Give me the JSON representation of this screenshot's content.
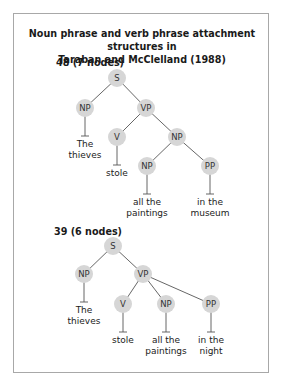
{
  "figure": {
    "title_line1": "Noun phrase and verb phrase attachment structures in",
    "title_line2": "Taraban and McClelland (1988)"
  },
  "trees": [
    {
      "label": "48 (7 nodes)",
      "nodes": [
        {
          "id": "S",
          "label": "S",
          "x": 117,
          "y": 78
        },
        {
          "id": "NP1",
          "label": "NP",
          "x": 85,
          "y": 108
        },
        {
          "id": "VP",
          "label": "VP",
          "x": 146,
          "y": 108
        },
        {
          "id": "V",
          "label": "V",
          "x": 117,
          "y": 137
        },
        {
          "id": "NP2",
          "label": "NP",
          "x": 177,
          "y": 137
        },
        {
          "id": "NP3",
          "label": "NP",
          "x": 147,
          "y": 166
        },
        {
          "id": "PP",
          "label": "PP",
          "x": 210,
          "y": 166
        }
      ],
      "edges": [
        [
          "S",
          "NP1"
        ],
        [
          "S",
          "VP"
        ],
        [
          "VP",
          "V"
        ],
        [
          "VP",
          "NP2"
        ],
        [
          "NP2",
          "NP3"
        ],
        [
          "NP2",
          "PP"
        ]
      ],
      "leaves": [
        {
          "node": "NP1",
          "lines": [
            "The",
            "thieves"
          ]
        },
        {
          "node": "V",
          "lines": [
            "stole"
          ]
        },
        {
          "node": "NP3",
          "lines": [
            "all the",
            "paintings"
          ]
        },
        {
          "node": "PP",
          "lines": [
            "in the",
            "museum"
          ]
        }
      ]
    },
    {
      "label": "39 (6 nodes)",
      "nodes": [
        {
          "id": "S",
          "label": "S",
          "x": 113,
          "y": 246
        },
        {
          "id": "NP1",
          "label": "NP",
          "x": 84,
          "y": 274
        },
        {
          "id": "VP",
          "label": "VP",
          "x": 143,
          "y": 274
        },
        {
          "id": "V",
          "label": "V",
          "x": 123,
          "y": 304
        },
        {
          "id": "NP2",
          "label": "NP",
          "x": 166,
          "y": 304
        },
        {
          "id": "PP",
          "label": "PP",
          "x": 211,
          "y": 304
        }
      ],
      "edges": [
        [
          "S",
          "NP1"
        ],
        [
          "S",
          "VP"
        ],
        [
          "VP",
          "V"
        ],
        [
          "VP",
          "NP2"
        ],
        [
          "VP",
          "PP"
        ]
      ],
      "leaves": [
        {
          "node": "NP1",
          "lines": [
            "The",
            "thieves"
          ]
        },
        {
          "node": "V",
          "lines": [
            "stole"
          ]
        },
        {
          "node": "NP2",
          "lines": [
            "all the",
            "paintings"
          ]
        },
        {
          "node": "PP",
          "lines": [
            "in the",
            "night"
          ]
        }
      ]
    }
  ],
  "colors": {
    "node_fill": "#d6d6d6",
    "edge": "#555555",
    "frame": "#a8a8a8"
  }
}
